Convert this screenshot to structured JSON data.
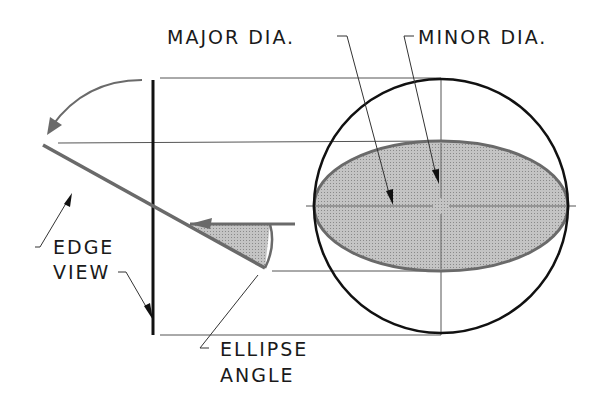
{
  "labels": {
    "major_dia": "MAJOR DIA.",
    "minor_dia": "MINOR DIA.",
    "edge_line1": "EDGE",
    "edge_line2": "VIEW",
    "angle_line1": "ELLIPSE",
    "angle_line2": "ANGLE"
  },
  "colors": {
    "ink": "#111111",
    "thin": "#555555",
    "gray_line": "#6a6a6a",
    "fill": "#b8b8b8"
  },
  "geometry": {
    "circle": {
      "cx": 441,
      "cy": 206,
      "r": 127
    },
    "ellipse": {
      "cx": 441,
      "cy": 206,
      "rx": 127,
      "ry": 65
    },
    "edge_view_plane": {
      "x1": 43,
      "y1": 145,
      "x2": 265,
      "y2": 268
    },
    "vertical_plane_x": 153
  }
}
